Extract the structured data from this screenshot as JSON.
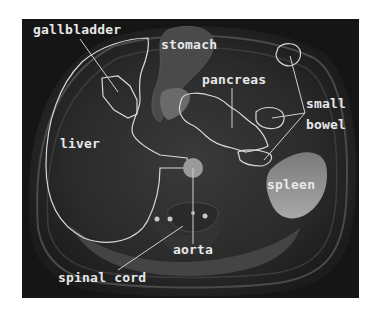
{
  "figure": {
    "type": "axial abdominal MRI with anatomical labels",
    "colors": {
      "background": "#ffffff",
      "scan_background": "#1a1a1a",
      "label_text": "#e8e8e8",
      "outline": "#d8d8d8"
    }
  },
  "labels": [
    {
      "id": "gallbladder",
      "text": "gallbladder",
      "x": 33,
      "y": 34
    },
    {
      "id": "stomach",
      "text": "stomach",
      "x": 161,
      "y": 49
    },
    {
      "id": "pancreas",
      "text": "pancreas",
      "x": 202,
      "y": 84
    },
    {
      "id": "small",
      "text": "small",
      "x": 306,
      "y": 108
    },
    {
      "id": "bowel",
      "text": "bowel",
      "x": 306,
      "y": 129
    },
    {
      "id": "liver",
      "text": "liver",
      "x": 60,
      "y": 148
    },
    {
      "id": "spleen",
      "text": "spleen",
      "x": 267,
      "y": 189
    },
    {
      "id": "aorta",
      "text": "aorta",
      "x": 173,
      "y": 254
    },
    {
      "id": "spinal_cord",
      "text": "spinal cord",
      "x": 58,
      "y": 282
    }
  ]
}
